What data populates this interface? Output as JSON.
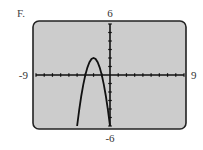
{
  "panel_label": "F.",
  "chart_data": {
    "type": "line",
    "title": "",
    "xlabel": "",
    "ylabel": "",
    "xlim": [
      -9,
      9
    ],
    "ylim": [
      -6,
      6
    ],
    "x_tick_step": 1,
    "y_tick_step": 1,
    "grid": false,
    "window_labels": {
      "xmin": "-9",
      "xmax": "9",
      "ymin": "-6",
      "ymax": "6"
    },
    "series": [
      {
        "name": "graph",
        "equation": "y = -2(x + 2)^2 + 2",
        "x": [
          -4.0,
          -3.75,
          -3.5,
          -3.25,
          -3.0,
          -2.75,
          -2.5,
          -2.25,
          -2.0,
          -1.75,
          -1.5,
          -1.25,
          -1.0,
          -0.75,
          -0.5,
          -0.25,
          0.0
        ],
        "y": [
          -6.0,
          -4.125,
          -2.5,
          -1.125,
          0.0,
          0.875,
          1.5,
          1.875,
          2.0,
          1.875,
          1.5,
          0.875,
          0.0,
          -1.125,
          -2.5,
          -4.125,
          -6.0
        ]
      }
    ],
    "colors": {
      "screen": "#cccccc",
      "frame": "#222222",
      "curve": "#111111",
      "axes": "#111111"
    }
  }
}
